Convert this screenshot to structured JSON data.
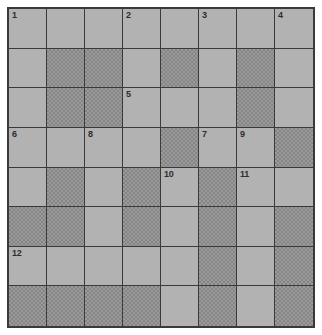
{
  "puzzle": {
    "type": "crossword-grid",
    "rows": 8,
    "columns": 8,
    "colors": {
      "page_background": "#ffffff",
      "open_cell": "#b2b2b2",
      "blocked_cell": "#9a9a9a",
      "blocked_cell_pattern": "#858585",
      "grid_line": "#3a3a3a",
      "number_text": "#2e2e2e"
    },
    "cells": [
      [
        {
          "state": "open",
          "number": "1"
        },
        {
          "state": "open",
          "number": ""
        },
        {
          "state": "open",
          "number": ""
        },
        {
          "state": "open",
          "number": "2"
        },
        {
          "state": "open",
          "number": ""
        },
        {
          "state": "open",
          "number": "3"
        },
        {
          "state": "open",
          "number": ""
        },
        {
          "state": "open",
          "number": "4"
        }
      ],
      [
        {
          "state": "open",
          "number": ""
        },
        {
          "state": "blocked",
          "number": ""
        },
        {
          "state": "blocked",
          "number": ""
        },
        {
          "state": "open",
          "number": ""
        },
        {
          "state": "blocked",
          "number": ""
        },
        {
          "state": "open",
          "number": ""
        },
        {
          "state": "blocked",
          "number": ""
        },
        {
          "state": "open",
          "number": ""
        }
      ],
      [
        {
          "state": "open",
          "number": ""
        },
        {
          "state": "blocked",
          "number": ""
        },
        {
          "state": "blocked",
          "number": ""
        },
        {
          "state": "open",
          "number": "5"
        },
        {
          "state": "open",
          "number": ""
        },
        {
          "state": "open",
          "number": ""
        },
        {
          "state": "blocked",
          "number": ""
        },
        {
          "state": "open",
          "number": ""
        }
      ],
      [
        {
          "state": "open",
          "number": "6"
        },
        {
          "state": "open",
          "number": ""
        },
        {
          "state": "open",
          "number": "8"
        },
        {
          "state": "open",
          "number": ""
        },
        {
          "state": "blocked",
          "number": ""
        },
        {
          "state": "open",
          "number": "7"
        },
        {
          "state": "open",
          "number": "9"
        },
        {
          "state": "blocked",
          "number": ""
        }
      ],
      [
        {
          "state": "open",
          "number": ""
        },
        {
          "state": "blocked",
          "number": ""
        },
        {
          "state": "open",
          "number": ""
        },
        {
          "state": "blocked",
          "number": ""
        },
        {
          "state": "open",
          "number": "10"
        },
        {
          "state": "blocked",
          "number": ""
        },
        {
          "state": "open",
          "number": "11"
        },
        {
          "state": "open",
          "number": ""
        }
      ],
      [
        {
          "state": "blocked",
          "number": ""
        },
        {
          "state": "blocked",
          "number": ""
        },
        {
          "state": "open",
          "number": ""
        },
        {
          "state": "blocked",
          "number": ""
        },
        {
          "state": "open",
          "number": ""
        },
        {
          "state": "blocked",
          "number": ""
        },
        {
          "state": "open",
          "number": ""
        },
        {
          "state": "blocked",
          "number": ""
        }
      ],
      [
        {
          "state": "open",
          "number": "12"
        },
        {
          "state": "open",
          "number": ""
        },
        {
          "state": "open",
          "number": ""
        },
        {
          "state": "open",
          "number": ""
        },
        {
          "state": "open",
          "number": ""
        },
        {
          "state": "blocked",
          "number": ""
        },
        {
          "state": "open",
          "number": ""
        },
        {
          "state": "blocked",
          "number": ""
        }
      ],
      [
        {
          "state": "blocked",
          "number": ""
        },
        {
          "state": "blocked",
          "number": ""
        },
        {
          "state": "blocked",
          "number": ""
        },
        {
          "state": "blocked",
          "number": ""
        },
        {
          "state": "open",
          "number": ""
        },
        {
          "state": "blocked",
          "number": ""
        },
        {
          "state": "open",
          "number": ""
        },
        {
          "state": "blocked",
          "number": ""
        }
      ]
    ]
  }
}
